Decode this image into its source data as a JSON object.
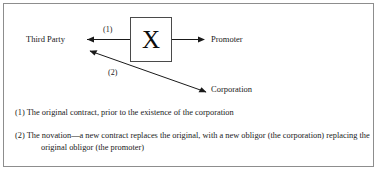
{
  "figure": {
    "type": "novation-contract-diagram",
    "border_color": "#8d8d8d",
    "text_color": "#1a1a1a"
  },
  "diagram": {
    "nodes": {
      "third_party": "Third Party",
      "promoter": "Promoter",
      "corporation": "Corporation",
      "center_box_glyph": "X"
    },
    "arrows": [
      {
        "id": "arrow-1",
        "number": "(1)",
        "from": "Promoter",
        "to": "Third Party",
        "direction": "left",
        "crossed_out": true
      },
      {
        "id": "arrow-2",
        "number": "(2)",
        "from": "Corporation",
        "to": "Third Party",
        "direction": "up-left",
        "crossed_out": false
      }
    ]
  },
  "notes": {
    "note_1": "(1) The original contract, prior to the existence of the corporation",
    "note_2": "(2) The novation—a new contract replaces the original, with a new obligor (the corporation) replacing the original obligor (the promoter)"
  }
}
